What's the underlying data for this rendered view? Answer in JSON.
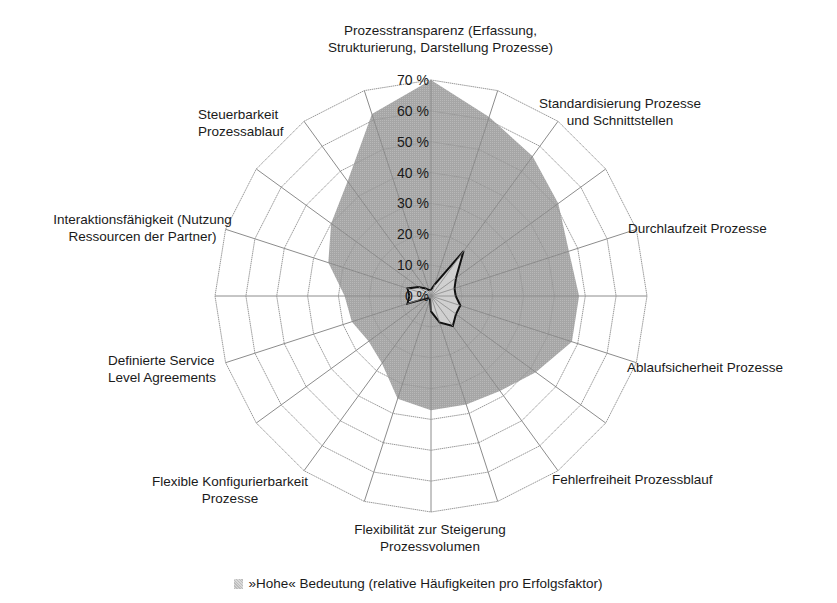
{
  "chart_data": {
    "type": "radar",
    "title": "",
    "num_axes": 20,
    "axis_labels": [
      "Prozesstransparenz (Erfassung, Strukturierung, Darstellung Prozesse)",
      "",
      "Standardisierung Prozesse und Schnittstellen",
      "",
      "Durchlaufzeit Prozesse",
      "",
      "Ablaufsicherheit Prozesse",
      "",
      "Fehlerfreiheit Prozessblauf",
      "",
      "Flexibilität zur Steigerung Prozessvolumen",
      "",
      "Flexible Konfigurierbarkeit Prozesse",
      "",
      "Definierte Service Level Agreements",
      "",
      "Interaktionsfähigkeit (Nutzung Ressourcen der Partner)",
      "",
      "Steuerbarkeit Prozessablauf",
      ""
    ],
    "tick_labels": [
      "0 %",
      "10 %",
      "20 %",
      "30 %",
      "40 %",
      "50 %",
      "60 %",
      "70 %"
    ],
    "rlim": [
      0,
      70
    ],
    "grid": true,
    "series": [
      {
        "name": "»Hohe« Bedeutung (relative Häufigkeiten pro Erfolgsfaktor)",
        "fill": "#a9a9a9",
        "values": [
          70,
          61,
          56,
          51,
          47,
          48,
          48,
          42,
          38,
          37,
          37,
          35,
          27,
          25,
          27,
          28,
          35,
          40,
          46,
          62
        ]
      },
      {
        "name": "",
        "fill": "#d6d6d6",
        "stroke": "#111111",
        "values": [
          2,
          4,
          18,
          10,
          8,
          8,
          10,
          10,
          12,
          9,
          5,
          1,
          1,
          1,
          8,
          7,
          8,
          5,
          3,
          2
        ]
      }
    ],
    "legend": {
      "position": "bottom",
      "entries": [
        "»Hohe« Bedeutung (relative Häufigkeiten pro Erfolgsfaktor)"
      ]
    }
  },
  "labels": {
    "a0": [
      "Prozesstransparenz (Erfassung,",
      "Strukturierung, Darstellung Prozesse)"
    ],
    "a2": [
      "Standardisierung Prozesse",
      "und Schnittstellen"
    ],
    "a4": [
      "Durchlaufzeit Prozesse"
    ],
    "a6": [
      "Ablaufsicherheit Prozesse"
    ],
    "a8": [
      "Fehlerfreiheit Prozessblauf"
    ],
    "a10": [
      "Flexibilität zur Steigerung",
      "Prozessvolumen"
    ],
    "a12": [
      "Flexible Konfigurierbarkeit",
      "Prozesse"
    ],
    "a14": [
      "Definierte Service",
      "Level Agreements"
    ],
    "a16": [
      "Interaktionsfähigkeit (Nutzung",
      "Ressourcen der Partner)"
    ],
    "a18": [
      "Steuerbarkeit",
      "Prozessablauf"
    ]
  },
  "legend": {
    "text": "»Hohe« Bedeutung (relative Häufigkeiten pro Erfolgsfaktor)"
  }
}
